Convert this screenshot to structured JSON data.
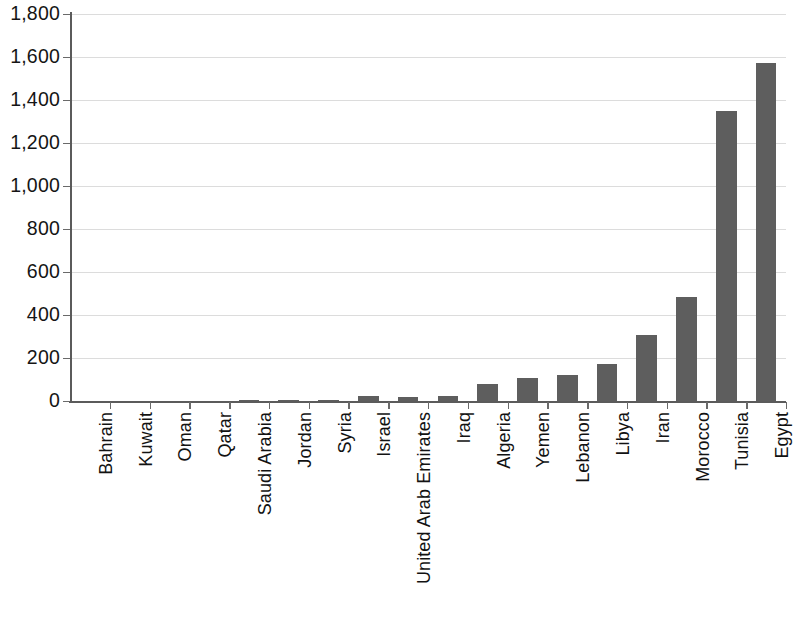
{
  "chart_data": {
    "type": "bar",
    "title": "",
    "subtitle": "",
    "xlabel": "",
    "ylabel": "",
    "legend": [],
    "grid": true,
    "orientation": "vertical",
    "bar_color": "#5e5e5e",
    "background_color": "#ffffff",
    "axis_color": "#5b5b5b",
    "gridline_color": "#dcdcdc",
    "ylim": [
      0,
      1800
    ],
    "ytick_interval": 200,
    "ytick_labels": [
      "0",
      "200",
      "400",
      "600",
      "800",
      "1,000",
      "1,200",
      "1,400",
      "1,600",
      "1,800"
    ],
    "ytick_values": [
      0,
      200,
      400,
      600,
      800,
      1000,
      1200,
      1400,
      1600,
      1800
    ],
    "xtick_rotation": -90,
    "categories": [
      "Bahrain",
      "Kuwait",
      "Oman",
      "Qatar",
      "Saudi Arabia",
      "Jordan",
      "Syria",
      "Israel",
      "United Arab Emirates",
      "Iraq",
      "Algeria",
      "Yemen",
      "Lebanon",
      "Libya",
      "Iran",
      "Morocco",
      "Tunisia",
      "Egypt"
    ],
    "values": [
      0,
      0,
      0,
      0,
      3,
      4,
      6,
      22,
      20,
      25,
      78,
      105,
      120,
      170,
      305,
      485,
      1350,
      1570
    ]
  }
}
